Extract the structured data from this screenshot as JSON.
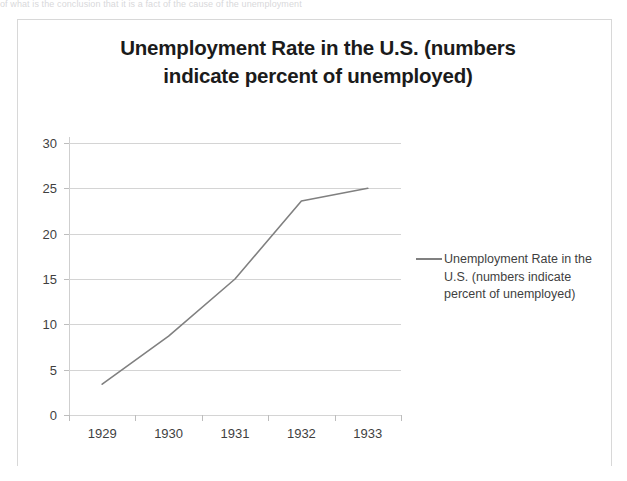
{
  "top_cropped_text": "of what is the conclusion that it is a fact of the cause of the unemployment",
  "chart_data": {
    "type": "line",
    "title": "Unemployment Rate in the U.S. (numbers indicate percent of unemployed)",
    "title_lines": [
      "Unemployment Rate in the U.S. (numbers",
      "indicate percent of unemployed)"
    ],
    "xlabel": "",
    "ylabel": "",
    "categories": [
      "1929",
      "1930",
      "1931",
      "1932",
      "1933"
    ],
    "x_tick_labels": [
      "1929",
      "1930",
      "1931",
      "1932",
      "1933"
    ],
    "y_tick_labels": [
      "0",
      "5",
      "10",
      "15",
      "20",
      "25",
      "30"
    ],
    "y_ticks": [
      0,
      5,
      10,
      15,
      20,
      25,
      30
    ],
    "ylim": [
      0,
      30
    ],
    "grid": true,
    "legend_position": "right",
    "series": [
      {
        "name": "Unemployment Rate in the U.S. (numbers indicate percent of unemployed)",
        "color": "#808080",
        "values": [
          3.4,
          8.7,
          15.0,
          23.6,
          25.0
        ]
      }
    ],
    "legend_entries": [
      {
        "label_lines": [
          "Unemployment Rate in the",
          "U.S. (numbers indicate",
          "percent of unemployed)"
        ],
        "color": "#808080"
      }
    ]
  }
}
